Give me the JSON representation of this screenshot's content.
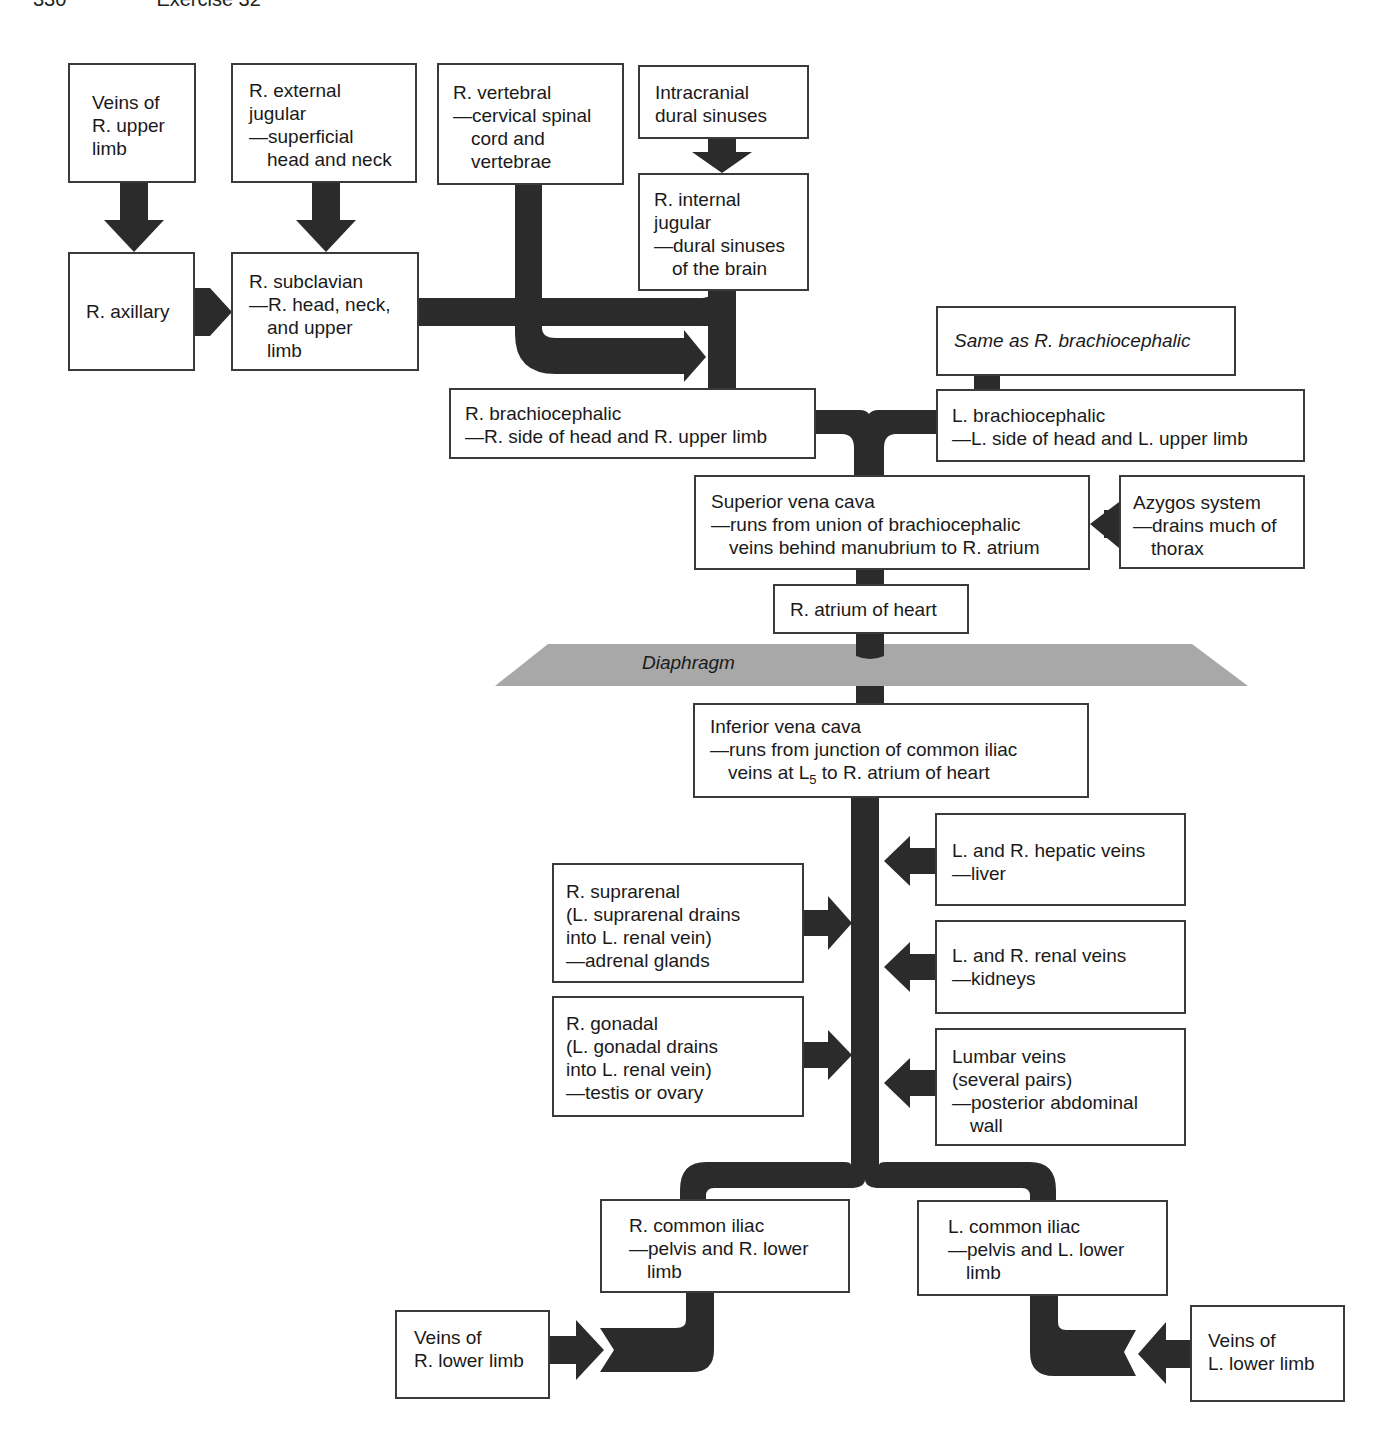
{
  "page_header": {
    "page_number": "330",
    "exercise": "Exercise 32"
  },
  "colors": {
    "vessel": "#2b2b2b",
    "box_border": "#3a3a3a",
    "diaphragm": "#a8a8a8",
    "background": "#ffffff"
  },
  "boxes": {
    "veins_r_upper_limb": {
      "lines": [
        "Veins of",
        "R. upper",
        "limb"
      ]
    },
    "r_external_jugular": {
      "lines": [
        "R. external",
        "jugular",
        "—superficial",
        "head and neck"
      ]
    },
    "r_vertebral": {
      "lines": [
        "R. vertebral",
        "—cervical spinal",
        "cord and",
        "vertebrae"
      ]
    },
    "intracranial_dural_sinuses": {
      "lines": [
        "Intracranial",
        "dural sinuses"
      ]
    },
    "r_internal_jugular": {
      "lines": [
        "R. internal",
        "jugular",
        "—dural sinuses",
        "of the brain"
      ]
    },
    "r_axillary": {
      "lines": [
        "R. axillary"
      ]
    },
    "r_subclavian": {
      "lines": [
        "R. subclavian",
        "—R. head, neck,",
        "and upper",
        "limb"
      ]
    },
    "same_as_r_brachiocephalic": {
      "lines": [
        "Same as R. brachiocephalic"
      ]
    },
    "r_brachiocephalic": {
      "lines": [
        "R. brachiocephalic",
        "—R. side of head and R. upper limb"
      ]
    },
    "l_brachiocephalic": {
      "lines": [
        "L. brachiocephalic",
        "—L. side of head and L. upper limb"
      ]
    },
    "superior_vena_cava": {
      "lines": [
        "Superior vena cava",
        "—runs from union of brachiocephalic",
        "veins behind manubrium to R. atrium"
      ]
    },
    "azygos_system": {
      "lines": [
        "Azygos system",
        "—drains much of",
        "thorax"
      ]
    },
    "r_atrium": {
      "lines": [
        "R. atrium of heart"
      ]
    },
    "inferior_vena_cava": {
      "lines": [
        "Inferior vena cava",
        "—runs from junction of common iliac",
        "veins at L",
        "5",
        " to R. atrium of heart"
      ]
    },
    "hepatic_veins": {
      "lines": [
        "L. and R. hepatic veins",
        "—liver"
      ]
    },
    "r_suprarenal": {
      "lines": [
        "R. suprarenal",
        "(L. suprarenal drains",
        "into L. renal vein)",
        "—adrenal glands"
      ]
    },
    "renal_veins": {
      "lines": [
        "L. and R. renal veins",
        "—kidneys"
      ]
    },
    "r_gonadal": {
      "lines": [
        "R. gonadal",
        "(L. gonadal drains",
        "into L. renal vein)",
        "—testis or ovary"
      ]
    },
    "lumbar_veins": {
      "lines": [
        "Lumbar veins",
        "(several pairs)",
        "—posterior abdominal",
        "wall"
      ]
    },
    "r_common_iliac": {
      "lines": [
        "R. common iliac",
        "—pelvis and R. lower",
        "limb"
      ]
    },
    "l_common_iliac": {
      "lines": [
        "L. common iliac",
        "—pelvis and L. lower",
        "limb"
      ]
    },
    "veins_r_lower_limb": {
      "lines": [
        "Veins of",
        "R. lower limb"
      ]
    },
    "veins_l_lower_limb": {
      "lines": [
        "Veins of",
        "L. lower limb"
      ]
    }
  },
  "diaphragm": {
    "label": "Diaphragm"
  }
}
